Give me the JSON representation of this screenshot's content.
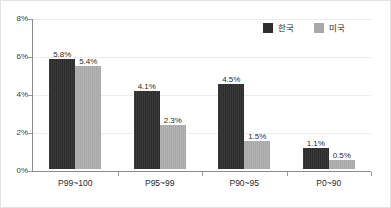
{
  "chart_data": {
    "type": "bar",
    "title": "",
    "subtitle": "",
    "xlabel": "",
    "ylabel": "",
    "categories": [
      "P99~100",
      "P95~99",
      "P90~95",
      "P0~90"
    ],
    "series": [
      {
        "name": "한국",
        "color": "#2e2e2e",
        "values": [
          5.8,
          4.1,
          4.5,
          1.1
        ],
        "labels": [
          "5.8%",
          "4.1%",
          "4.5%",
          "1.1%"
        ]
      },
      {
        "name": "미국",
        "color": "#a9a9a9",
        "values": [
          5.4,
          2.3,
          1.5,
          0.5
        ],
        "labels": [
          "5.4%",
          "2.3%",
          "1.5%",
          "0.5%"
        ]
      }
    ],
    "ylim": [
      0,
      8
    ],
    "yticks": [
      0,
      2,
      4,
      6,
      8
    ],
    "ytick_labels": [
      "0%",
      "2%",
      "4%",
      "6%",
      "8%"
    ],
    "grid": true,
    "grid_color": "#ececec",
    "legend_position": "top-right",
    "axis_color": "#8a8a8a",
    "plot_background": "#ffffff",
    "border_color": "#e3e3e3",
    "value_label_suffix": "%"
  },
  "legend": {
    "entries": [
      {
        "label": "한국"
      },
      {
        "label": "미국"
      }
    ]
  }
}
